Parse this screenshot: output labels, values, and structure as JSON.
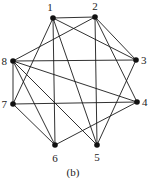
{
  "diagram": {
    "caption": "(b)",
    "nodes": [
      {
        "id": "1",
        "label": "1",
        "x": 53,
        "y": 18,
        "lx": 50,
        "ly": 11,
        "anchor": "middle"
      },
      {
        "id": "2",
        "label": "2",
        "x": 95,
        "y": 17,
        "lx": 95,
        "ly": 10,
        "anchor": "middle"
      },
      {
        "id": "3",
        "label": "3",
        "x": 136,
        "y": 60,
        "lx": 141,
        "ly": 64,
        "anchor": "start"
      },
      {
        "id": "4",
        "label": "4",
        "x": 137,
        "y": 102,
        "lx": 142,
        "ly": 106,
        "anchor": "start"
      },
      {
        "id": "5",
        "label": "5",
        "x": 97,
        "y": 145,
        "lx": 97,
        "ly": 161,
        "anchor": "middle"
      },
      {
        "id": "6",
        "label": "6",
        "x": 55,
        "y": 145,
        "lx": 55,
        "ly": 162,
        "anchor": "middle"
      },
      {
        "id": "7",
        "label": "7",
        "x": 13,
        "y": 104,
        "lx": 7,
        "ly": 108,
        "anchor": "end"
      },
      {
        "id": "8",
        "label": "8",
        "x": 13,
        "y": 61,
        "lx": 7,
        "ly": 65,
        "anchor": "end"
      }
    ],
    "edges": [
      [
        "1",
        "2"
      ],
      [
        "1",
        "3"
      ],
      [
        "1",
        "5"
      ],
      [
        "1",
        "6"
      ],
      [
        "1",
        "7"
      ],
      [
        "2",
        "3"
      ],
      [
        "2",
        "4"
      ],
      [
        "2",
        "5"
      ],
      [
        "2",
        "8"
      ],
      [
        "3",
        "5"
      ],
      [
        "3",
        "8"
      ],
      [
        "4",
        "6"
      ],
      [
        "4",
        "7"
      ],
      [
        "4",
        "8"
      ],
      [
        "5",
        "8"
      ],
      [
        "6",
        "7"
      ],
      [
        "6",
        "8"
      ],
      [
        "7",
        "8"
      ]
    ],
    "colors": {
      "line": "#1a1a1a",
      "node": "#111111",
      "text": "#222222"
    }
  }
}
